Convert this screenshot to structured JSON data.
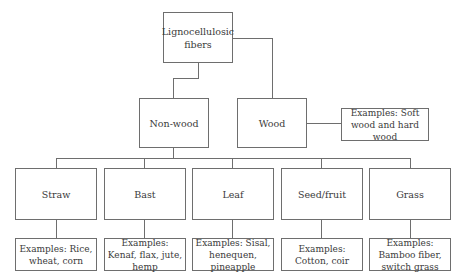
{
  "diagram": {
    "root": {
      "label": "Lignocellulosic fibers"
    },
    "level1": [
      {
        "label": "Non-wood"
      },
      {
        "label": "Wood",
        "examples": "Examples: Soft wood and hard wood"
      }
    ],
    "nonwood_children": [
      {
        "label": "Straw",
        "examples": "Examples: Rice, wheat, corn"
      },
      {
        "label": "Bast",
        "examples": "Examples: Kenaf, flax, jute, hemp"
      },
      {
        "label": "Leaf",
        "examples": "Examples: Sisal, henequen, pineapple"
      },
      {
        "label": "Seed/fruit",
        "examples": "Examples: Cotton, coir"
      },
      {
        "label": "Grass",
        "examples": "Examples: Bamboo fiber, switch grass"
      }
    ]
  }
}
